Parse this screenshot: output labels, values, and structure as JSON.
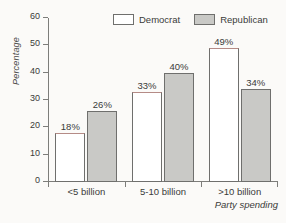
{
  "chart_data": {
    "type": "bar",
    "title": "",
    "xlabel": "Party spending",
    "ylabel": "Percentage",
    "categories": [
      "<5 billion",
      "5-10 billion",
      ">10 billion"
    ],
    "series": [
      {
        "name": "Democrat",
        "values": [
          18,
          33,
          49
        ],
        "labels": [
          "18%",
          "33%",
          "49%"
        ],
        "color": "#ffffff",
        "edge_color": "#6f6f6d"
      },
      {
        "name": "Republican",
        "values": [
          26,
          40,
          34
        ],
        "labels": [
          "26%",
          "40%",
          "34%"
        ],
        "color": "#c9c9c6",
        "edge_color": "#6f6f6d"
      }
    ],
    "ylim": [
      0,
      60
    ],
    "yticks": [
      0,
      10,
      20,
      30,
      40,
      50,
      60
    ],
    "ytick_labels": [
      "0",
      "10",
      "20",
      "30",
      "40",
      "50",
      "60"
    ],
    "grid": false,
    "legend_position": "top-center"
  },
  "legend": {
    "democrat_label": "Democrat",
    "republican_label": "Republican"
  },
  "axes": {
    "y_title": "Percentage",
    "x_title": "Party spending"
  }
}
